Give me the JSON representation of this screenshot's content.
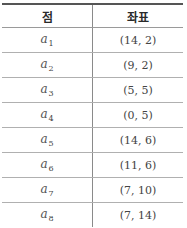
{
  "table": {
    "headers": {
      "point": "점",
      "coordinate": "좌표"
    },
    "rows": [
      {
        "var": "a",
        "sub": "1",
        "coord": "(14, 2)"
      },
      {
        "var": "a",
        "sub": "2",
        "coord": "(9, 2)"
      },
      {
        "var": "a",
        "sub": "3",
        "coord": "(5, 5)"
      },
      {
        "var": "a",
        "sub": "4",
        "coord": "(0, 5)"
      },
      {
        "var": "a",
        "sub": "5",
        "coord": "(14, 6)"
      },
      {
        "var": "a",
        "sub": "6",
        "coord": "(11, 6)"
      },
      {
        "var": "a",
        "sub": "7",
        "coord": "(7, 10)"
      },
      {
        "var": "a",
        "sub": "8",
        "coord": "(7, 14)"
      }
    ]
  }
}
